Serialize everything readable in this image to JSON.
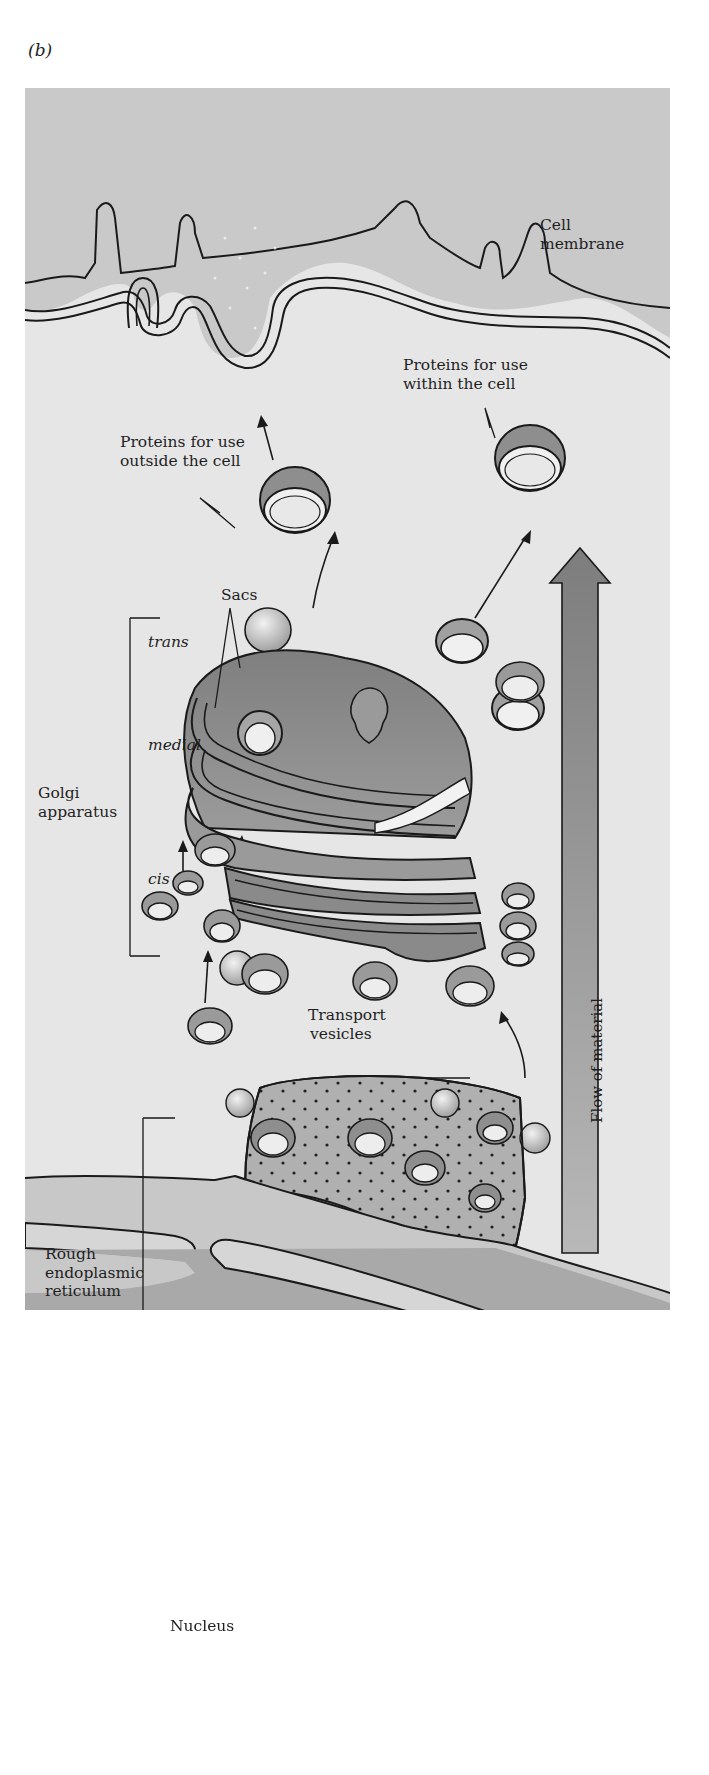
{
  "figure": {
    "panel_label": "(b)",
    "labels": {
      "cell_membrane": [
        "Cell",
        "membrane"
      ],
      "proteins_outside": [
        "Proteins for use",
        "outside the cell"
      ],
      "proteins_within": [
        "Proteins for use",
        "within the cell"
      ],
      "sacs": "Sacs",
      "golgi": [
        "Golgi",
        "apparatus"
      ],
      "golgi_regions": {
        "trans": "trans",
        "medial": "medial",
        "cis": "cis"
      },
      "transport_vesicles": [
        "Transport",
        "vesicles"
      ],
      "rough_er": [
        "Rough",
        "endoplasmic",
        "reticulum"
      ],
      "flow": "Flow of material",
      "nucleus": "Nucleus"
    },
    "colors": {
      "background": "#e6e6e6",
      "membrane_fill": "#cfcfcf",
      "organelle_dark": "#8a8a8a",
      "organelle_mid": "#a9a9a9",
      "lumen_light": "#efefef",
      "outline": "#1a1a1a",
      "nucleus_fill": "#b5b5b5",
      "arrow_fill": "#9a9a9a"
    }
  }
}
